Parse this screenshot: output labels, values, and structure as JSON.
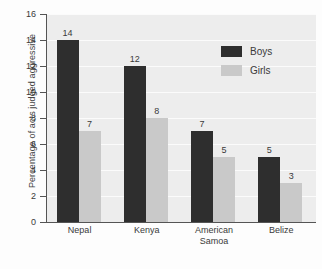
{
  "chart_data": {
    "type": "bar",
    "title": "",
    "xlabel": "",
    "ylabel": "Percentage of acts judged aggressive",
    "categories": [
      "Nepal",
      "Kenya",
      "American Samoa",
      "Belize"
    ],
    "category_lines": [
      [
        "Nepal"
      ],
      [
        "Kenya"
      ],
      [
        "American",
        "Samoa"
      ],
      [
        "Belize"
      ]
    ],
    "series": [
      {
        "name": "Boys",
        "values": [
          14,
          12,
          7,
          5
        ],
        "color": "#2e2e2e"
      },
      {
        "name": "Girls",
        "values": [
          7,
          8,
          5,
          3
        ],
        "color": "#c9c9c9"
      }
    ],
    "ylim": [
      0,
      16
    ],
    "yticks": [
      0,
      2,
      4,
      6,
      8,
      10,
      12,
      14,
      16
    ],
    "ytick_labels": [
      "0",
      "2",
      "4",
      "6",
      "8",
      "10",
      "12",
      "14",
      "16"
    ],
    "grid": true,
    "grid_axis": "y",
    "legend_position": "top-right",
    "value_labels": true,
    "plot_background": "#ededed",
    "gridline_color": "#fbfbfb",
    "axis_color": "#555555"
  },
  "legend": {
    "entries": [
      {
        "label": "Boys"
      },
      {
        "label": "Girls"
      }
    ]
  }
}
